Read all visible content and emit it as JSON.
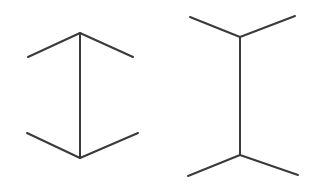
{
  "image": {
    "title": "Muller-Lyer illusion figure pair",
    "width": 323,
    "height": 190,
    "background_color": "#ffffff",
    "line_color": "#3a3a3a",
    "line_width": 2
  },
  "figures": [
    {
      "id": "left-figure",
      "name": "arrowheads-inward-figure",
      "description": "Vertical shaft with chevron fins angling outward-downward at top and outward-upward at bottom",
      "shaft": {
        "x1": 80,
        "y1": 33,
        "x2": 80,
        "y2": 158,
        "length": 125
      },
      "fins": [
        {
          "name": "top-left-fin",
          "x1": 80,
          "y1": 33,
          "x2": 28,
          "y2": 57
        },
        {
          "name": "top-right-fin",
          "x1": 80,
          "y1": 33,
          "x2": 133,
          "y2": 57
        },
        {
          "name": "bottom-left-fin",
          "x1": 80,
          "y1": 158,
          "x2": 27,
          "y2": 133
        },
        {
          "name": "bottom-right-fin",
          "x1": 80,
          "y1": 158,
          "x2": 138,
          "y2": 133
        }
      ]
    },
    {
      "id": "right-figure",
      "name": "arrowheads-outward-figure",
      "description": "Vertical shaft with fins angling outward-upward at top and outward-downward at bottom",
      "shaft": {
        "x1": 240,
        "y1": 37,
        "x2": 240,
        "y2": 155,
        "length": 118
      },
      "fins": [
        {
          "name": "top-left-fin",
          "x1": 240,
          "y1": 37,
          "x2": 190,
          "y2": 17
        },
        {
          "name": "top-right-fin",
          "x1": 240,
          "y1": 37,
          "x2": 295,
          "y2": 16
        },
        {
          "name": "bottom-left-fin",
          "x1": 240,
          "y1": 155,
          "x2": 188,
          "y2": 176
        },
        {
          "name": "bottom-right-fin",
          "x1": 240,
          "y1": 155,
          "x2": 298,
          "y2": 175
        }
      ]
    }
  ]
}
